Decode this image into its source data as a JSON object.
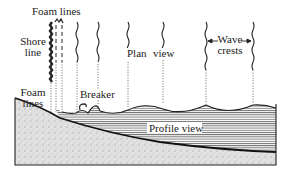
{
  "diagram": {
    "labels": {
      "foam_lines_top": "Foam lines",
      "shore_line_1": "Shore",
      "shore_line_2": "line",
      "plan": "Plan",
      "view": "view",
      "wave_1": "Wave",
      "wave_2": "crests",
      "foam_lines_bottom_1": "Foam",
      "foam_lines_bottom_2": "lines",
      "breaker": "Breaker",
      "profile_view": "Profile view"
    },
    "colors": {
      "ink": "#222222",
      "sand": "#d9d9d9",
      "water_hatch": "#555555",
      "background": "#ffffff"
    }
  }
}
